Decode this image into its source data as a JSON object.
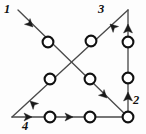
{
  "figure": {
    "type": "directed-graph-diagram",
    "width": 146,
    "height": 134,
    "background_color": "#fdfdfd",
    "line_color": "#4a4a4a",
    "node_fill_color": "#ffffff",
    "node_stroke_color": "#111111",
    "arrow_color": "#1a1a1a"
  },
  "labels": [
    {
      "id": "label-1",
      "text": "1",
      "x": 4,
      "y": 3,
      "position": "top-left"
    },
    {
      "id": "label-3",
      "text": "3",
      "x": 98,
      "y": 3,
      "position": "top-right-of-center"
    },
    {
      "id": "label-2",
      "text": "2",
      "x": 133,
      "y": 94,
      "position": "right-lower"
    },
    {
      "id": "label-4",
      "text": "4",
      "x": 22,
      "y": 120,
      "position": "bottom-left"
    }
  ],
  "vertices": [
    {
      "id": "v-top-right",
      "x": 128,
      "y": 10,
      "name": "top-right-apex"
    },
    {
      "id": "v-bottom-left",
      "x": 12,
      "y": 117,
      "name": "bottom-left-corner"
    },
    {
      "id": "v-bottom-right",
      "x": 128,
      "y": 117,
      "name": "bottom-right-corner"
    },
    {
      "id": "v-start-1",
      "x": 18,
      "y": 10,
      "name": "edge-1-origin"
    }
  ],
  "edges": [
    {
      "id": "edge-1",
      "label": "1",
      "from": {
        "x": 18,
        "y": 10
      },
      "to": {
        "x": 128,
        "y": 117
      },
      "direction": "down-right"
    },
    {
      "id": "edge-3",
      "label": "3",
      "from": {
        "x": 128,
        "y": 10
      },
      "to": {
        "x": 12,
        "y": 117
      },
      "direction": "down-left"
    },
    {
      "id": "edge-4",
      "label": "4",
      "from": {
        "x": 12,
        "y": 117
      },
      "to": {
        "x": 128,
        "y": 117
      },
      "direction": "right"
    },
    {
      "id": "edge-2",
      "label": "2",
      "from": {
        "x": 128,
        "y": 117
      },
      "to": {
        "x": 128,
        "y": 10
      },
      "direction": "up"
    }
  ],
  "nodes": [
    {
      "id": "node-1a",
      "edge": "edge-1",
      "x": 48,
      "y": 42,
      "r": 5.4
    },
    {
      "id": "node-1b",
      "edge": "edge-1",
      "x": 90,
      "y": 79,
      "r": 5.4
    },
    {
      "id": "node-3a",
      "edge": "edge-3",
      "x": 91,
      "y": 41,
      "r": 5.4
    },
    {
      "id": "node-3b",
      "edge": "edge-3",
      "x": 50,
      "y": 79,
      "r": 5.4
    },
    {
      "id": "node-4a",
      "edge": "edge-4",
      "x": 50,
      "y": 117,
      "r": 5.4
    },
    {
      "id": "node-4b",
      "edge": "edge-4",
      "x": 90,
      "y": 117,
      "r": 5.4
    },
    {
      "id": "node-2a",
      "edge": "edge-2",
      "x": 128,
      "y": 78,
      "r": 5.4
    },
    {
      "id": "node-2b",
      "edge": "edge-2",
      "x": 128,
      "y": 42,
      "r": 5.4
    },
    {
      "id": "node-corner",
      "edge": "vertex",
      "x": 128,
      "y": 117,
      "r": 5.4
    }
  ],
  "arrowheads": [
    {
      "id": "arrow-1",
      "edge": "edge-1",
      "x": 33,
      "y": 27,
      "angle": 44
    },
    {
      "id": "arrow-1b",
      "edge": "edge-1",
      "x": 107,
      "y": 98,
      "angle": 44
    },
    {
      "id": "arrow-3",
      "edge": "edge-3",
      "x": 110,
      "y": 24,
      "angle": 223
    },
    {
      "id": "arrow-3b",
      "edge": "edge-3",
      "x": 30,
      "y": 101,
      "angle": 223
    },
    {
      "id": "arrow-4a",
      "edge": "edge-4",
      "x": 32,
      "y": 117,
      "angle": 0
    },
    {
      "id": "arrow-4b",
      "edge": "edge-4",
      "x": 73,
      "y": 117,
      "angle": 0
    },
    {
      "id": "arrow-2a",
      "edge": "edge-2",
      "x": 128,
      "y": 92,
      "angle": 270
    },
    {
      "id": "arrow-2b",
      "edge": "edge-2",
      "x": 128,
      "y": 24,
      "angle": 270
    }
  ]
}
